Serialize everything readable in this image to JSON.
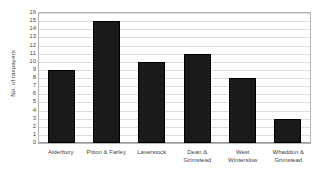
{
  "chart_data": {
    "type": "bar",
    "title": "",
    "xlabel": "",
    "ylabel": "No. of taxpayers",
    "categories": [
      "Alderbury",
      "Pitton & Farley",
      "Laverstock",
      "Dean & Grimstead",
      "West Winterslow",
      "Whaddon & Grimstead"
    ],
    "values": [
      9,
      15,
      10,
      11,
      8,
      3
    ],
    "ylim": [
      0,
      16
    ],
    "ytick_labels": [
      "16",
      "15",
      "14",
      "13",
      "12",
      "11",
      "10",
      "9",
      "8",
      "7",
      "6",
      "5",
      "4",
      "3",
      "2",
      "1",
      "0"
    ],
    "ytick_values": [
      16,
      15,
      14,
      13,
      12,
      11,
      10,
      9,
      8,
      7,
      6,
      5,
      4,
      3,
      2,
      1,
      0
    ],
    "grid": true,
    "legend": false,
    "legend_position": "none",
    "bar_color": "#1a1a1a",
    "gridline_color": "#dcdcdc",
    "axis_color": "#b6b6b6",
    "background_color": "#ffffff"
  }
}
